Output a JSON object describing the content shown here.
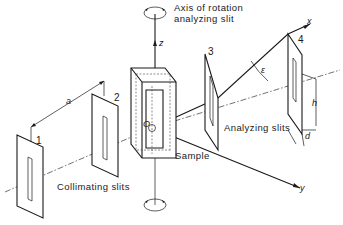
{
  "diagram": {
    "labels": {
      "axis_rotation_line1": "Axis of rotation",
      "axis_rotation_line2": "analyzing slit",
      "sample": "Sample",
      "collimating_slits": "Collimating slits",
      "analyzing_slits": "Analyzing slits"
    },
    "slit_numbers": [
      "1",
      "2",
      "3",
      "4"
    ],
    "symbols": {
      "a": "a",
      "epsilon": "ε",
      "h": "h",
      "d": "d",
      "origin": "O",
      "x_axis": "x",
      "y_axis": "y",
      "z_axis": "z"
    },
    "line_color": "#1a1a1a",
    "background": "#ffffff"
  }
}
